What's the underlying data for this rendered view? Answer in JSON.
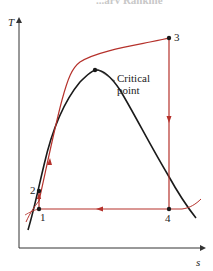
{
  "header": {
    "cut_title": "...ary Rankine"
  },
  "axes": {
    "y_label": "T",
    "x_label": "s"
  },
  "annotation": {
    "line1": "Critical",
    "line2": "point"
  },
  "states": [
    {
      "id": "1",
      "label": "1"
    },
    {
      "id": "2",
      "label": "2"
    },
    {
      "id": "3",
      "label": "3"
    },
    {
      "id": "4",
      "label": "4"
    }
  ],
  "colors": {
    "cycle": "#b5312b",
    "dome": "#1a1a1a",
    "axis": "#333333"
  }
}
